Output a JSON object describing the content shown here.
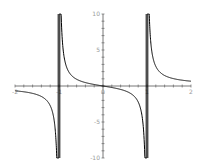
{
  "chart_data": {
    "type": "line",
    "title": "",
    "xlabel": "",
    "ylabel": "",
    "function": "x/(x^2-1)",
    "xlim": [
      -2,
      2
    ],
    "ylim": [
      -10,
      10
    ],
    "grid": false,
    "legend": null,
    "asymptotes": [
      -1,
      1
    ],
    "x_ticks": [
      -2,
      -1,
      0,
      1,
      2
    ],
    "x_tick_labels": [
      "-2",
      "-1",
      "0",
      "1",
      "2"
    ],
    "y_ticks": [
      -10,
      -5,
      5,
      10
    ],
    "y_tick_labels": [
      "-10",
      "-5",
      "5",
      "10"
    ],
    "series": [
      {
        "name": "x/(x^2-1)",
        "points": [
          [
            -2,
            -0.667
          ],
          [
            -1.75,
            -0.848
          ],
          [
            -1.5,
            -1.2
          ],
          [
            -1.3,
            -1.884
          ],
          [
            -1.2,
            -2.727
          ],
          [
            -1.1,
            -5.238
          ],
          [
            -1.05,
            -10
          ],
          [
            -0.95,
            10
          ],
          [
            -0.9,
            4.737
          ],
          [
            -0.8,
            2.222
          ],
          [
            -0.6,
            0.938
          ],
          [
            -0.4,
            0.476
          ],
          [
            -0.2,
            0.208
          ],
          [
            0,
            0
          ],
          [
            0.2,
            -0.208
          ],
          [
            0.4,
            -0.476
          ],
          [
            0.6,
            -0.938
          ],
          [
            0.8,
            -2.222
          ],
          [
            0.9,
            -4.737
          ],
          [
            0.95,
            -10
          ],
          [
            1.05,
            10
          ],
          [
            1.1,
            5.238
          ],
          [
            1.2,
            2.727
          ],
          [
            1.3,
            1.884
          ],
          [
            1.5,
            1.2
          ],
          [
            1.75,
            0.848
          ],
          [
            2,
            0.667
          ]
        ]
      }
    ],
    "colors": {
      "curve": "#000000",
      "axes": "#555555",
      "labels": "#9a9a9a"
    }
  }
}
